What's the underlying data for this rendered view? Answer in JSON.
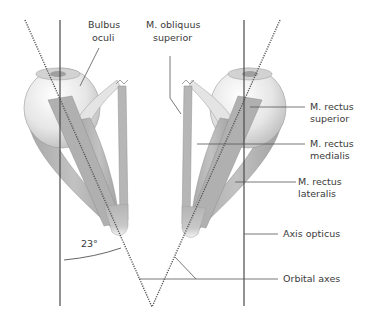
{
  "figure": {
    "colors": {
      "muscle": "#b8b8b8",
      "muscle_dark": "#9a9a9a",
      "globe": "#ececec",
      "globe_shade": "#c9c9c9",
      "line": "#4a4a4a",
      "background": "#ffffff"
    },
    "labels": {
      "bulbus_oculi_1": "Bulbus",
      "bulbus_oculi_2": "oculi",
      "obliquus_superior_1": "M. obliquus",
      "obliquus_superior_2": "superior",
      "rectus_superior_1": "M. rectus",
      "rectus_superior_2": "superior",
      "rectus_medialis_1": "M. rectus",
      "rectus_medialis_2": "medialis",
      "rectus_lateralis_1": "M. rectus",
      "rectus_lateralis_2": "lateralis",
      "axis_opticus": "Axis opticus",
      "orbital_axes": "Orbital axes",
      "angle": "23°"
    }
  }
}
